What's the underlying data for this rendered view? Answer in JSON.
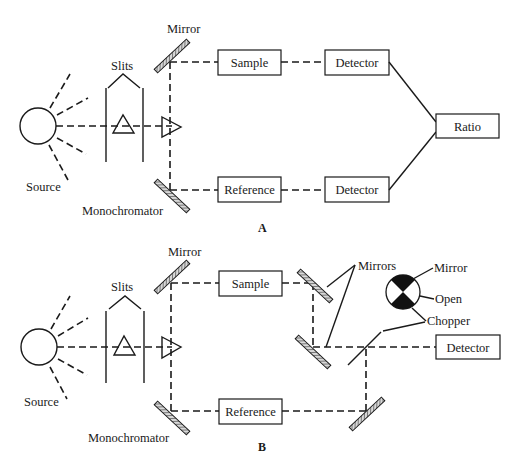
{
  "diagram": {
    "panel_a": {
      "caption": "A",
      "labels": {
        "mirror": "Mirror",
        "slits": "Slits",
        "source": "Source",
        "monochromator": "Monochromator"
      },
      "boxes": {
        "sample": "Sample",
        "reference": "Reference",
        "detector_top": "Detector",
        "detector_bottom": "Detector",
        "ratio": "Ratio"
      }
    },
    "panel_b": {
      "caption": "B",
      "labels": {
        "mirror": "Mirror",
        "slits": "Slits",
        "source": "Source",
        "monochromator": "Monochromator",
        "mirrors": "Mirrors",
        "chopper_mirror": "Mirror",
        "chopper_open": "Open",
        "chopper": "Chopper"
      },
      "boxes": {
        "sample": "Sample",
        "reference": "Reference",
        "detector": "Detector"
      }
    }
  }
}
